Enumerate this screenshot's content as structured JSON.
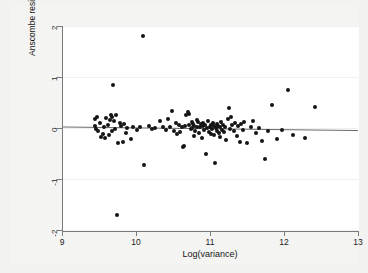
{
  "chart_data": {
    "type": "scatter",
    "title": "",
    "xlabel": "Log(variance)",
    "ylabel": "Anscombe residual",
    "xlim": [
      9,
      13
    ],
    "ylim": [
      -2,
      2
    ],
    "xticks": [
      9,
      10,
      11,
      12,
      13
    ],
    "xtick_labels": [
      "9",
      "10",
      "11",
      "12",
      "13"
    ],
    "yticks": [
      -2,
      -1,
      0,
      1,
      2
    ],
    "ytick_labels": [
      "-2",
      "-1",
      "0",
      "1",
      "2"
    ],
    "grid": true,
    "legend": "none",
    "marker_color": "#151515",
    "reference_line": {
      "label": "fitted residual reference line",
      "color": "#6b6b6b",
      "x_start": 9.0,
      "y_start": 0.02,
      "x_end": 13.0,
      "y_end": -0.05
    },
    "points": [
      [
        9.44,
        0.17
      ],
      [
        9.45,
        0.03
      ],
      [
        9.46,
        -0.02
      ],
      [
        9.47,
        0.22
      ],
      [
        9.49,
        -0.06
      ],
      [
        9.52,
        0.09
      ],
      [
        9.53,
        -0.17
      ],
      [
        9.55,
        -0.11
      ],
      [
        9.57,
        0.01
      ],
      [
        9.58,
        -0.2
      ],
      [
        9.6,
        0.19
      ],
      [
        9.62,
        0.05
      ],
      [
        9.63,
        -0.13
      ],
      [
        9.65,
        0.15
      ],
      [
        9.66,
        0.26
      ],
      [
        9.67,
        0.21
      ],
      [
        9.68,
        -0.05
      ],
      [
        9.69,
        0.84
      ],
      [
        9.7,
        0.13
      ],
      [
        9.71,
        -0.01
      ],
      [
        9.73,
        0.25
      ],
      [
        9.74,
        -1.7
      ],
      [
        9.76,
        -0.3
      ],
      [
        9.78,
        0.1
      ],
      [
        9.8,
        0.04
      ],
      [
        9.82,
        -0.27
      ],
      [
        9.84,
        0.07
      ],
      [
        9.86,
        -0.1
      ],
      [
        9.88,
        0.0
      ],
      [
        9.93,
        -0.21
      ],
      [
        9.96,
        0.02
      ],
      [
        10.02,
        -0.03
      ],
      [
        10.05,
        0.01
      ],
      [
        10.09,
        1.8
      ],
      [
        10.11,
        -0.73
      ],
      [
        10.18,
        0.03
      ],
      [
        10.22,
        -0.02
      ],
      [
        10.26,
        0.0
      ],
      [
        10.32,
        0.13
      ],
      [
        10.36,
        0.02
      ],
      [
        10.4,
        -0.04
      ],
      [
        10.43,
        0.17
      ],
      [
        10.46,
        0.02
      ],
      [
        10.49,
        0.34
      ],
      [
        10.52,
        -0.06
      ],
      [
        10.54,
        0.1
      ],
      [
        10.56,
        -0.12
      ],
      [
        10.58,
        0.05
      ],
      [
        10.6,
        -0.08
      ],
      [
        10.62,
        0.01
      ],
      [
        10.64,
        -0.38
      ],
      [
        10.65,
        -0.35
      ],
      [
        10.66,
        0.03
      ],
      [
        10.68,
        0.26
      ],
      [
        10.7,
        0.31
      ],
      [
        10.71,
        0.27
      ],
      [
        10.72,
        0.06
      ],
      [
        10.74,
        -0.02
      ],
      [
        10.75,
        0.12
      ],
      [
        10.76,
        0.0
      ],
      [
        10.77,
        0.08
      ],
      [
        10.78,
        -0.16
      ],
      [
        10.79,
        0.04
      ],
      [
        10.8,
        -0.05
      ],
      [
        10.82,
        0.15
      ],
      [
        10.83,
        0.02
      ],
      [
        10.84,
        0.11
      ],
      [
        10.85,
        -0.09
      ],
      [
        10.86,
        0.01
      ],
      [
        10.88,
        0.07
      ],
      [
        10.89,
        -0.19
      ],
      [
        10.9,
        0.03
      ],
      [
        10.91,
        0.09
      ],
      [
        10.92,
        -0.03
      ],
      [
        10.93,
        0.05
      ],
      [
        10.95,
        -0.5
      ],
      [
        10.96,
        0.0
      ],
      [
        10.97,
        0.14
      ],
      [
        10.98,
        -0.07
      ],
      [
        11.0,
        0.02
      ],
      [
        11.01,
        -0.12
      ],
      [
        11.02,
        0.06
      ],
      [
        11.03,
        -0.01
      ],
      [
        11.04,
        0.1
      ],
      [
        11.05,
        -0.14
      ],
      [
        11.06,
        0.03
      ],
      [
        11.07,
        -0.69
      ],
      [
        11.08,
        0.0
      ],
      [
        11.09,
        0.08
      ],
      [
        11.1,
        -0.05
      ],
      [
        11.11,
        0.04
      ],
      [
        11.12,
        -0.1
      ],
      [
        11.13,
        0.01
      ],
      [
        11.14,
        -0.18
      ],
      [
        11.15,
        0.12
      ],
      [
        11.16,
        -0.03
      ],
      [
        11.17,
        0.06
      ],
      [
        11.19,
        -0.08
      ],
      [
        11.2,
        0.02
      ],
      [
        11.22,
        -0.23
      ],
      [
        11.24,
        0.18
      ],
      [
        11.25,
        0.4
      ],
      [
        11.27,
        -0.02
      ],
      [
        11.28,
        0.21
      ],
      [
        11.3,
        0.05
      ],
      [
        11.32,
        -0.06
      ],
      [
        11.34,
        0.09
      ],
      [
        11.36,
        -0.15
      ],
      [
        11.38,
        0.03
      ],
      [
        11.4,
        -0.27
      ],
      [
        11.42,
        0.07
      ],
      [
        11.44,
        -0.04
      ],
      [
        11.46,
        0.11
      ],
      [
        11.5,
        -0.3
      ],
      [
        11.55,
        0.02
      ],
      [
        11.58,
        0.13
      ],
      [
        11.62,
        -0.09
      ],
      [
        11.66,
        0.0
      ],
      [
        11.7,
        -0.26
      ],
      [
        11.74,
        -0.6
      ],
      [
        11.78,
        -0.05
      ],
      [
        11.84,
        0.46
      ],
      [
        11.9,
        -0.21
      ],
      [
        11.97,
        -0.03
      ],
      [
        12.06,
        0.75
      ],
      [
        12.12,
        -0.14
      ],
      [
        12.28,
        -0.2
      ],
      [
        12.42,
        0.41
      ]
    ]
  }
}
